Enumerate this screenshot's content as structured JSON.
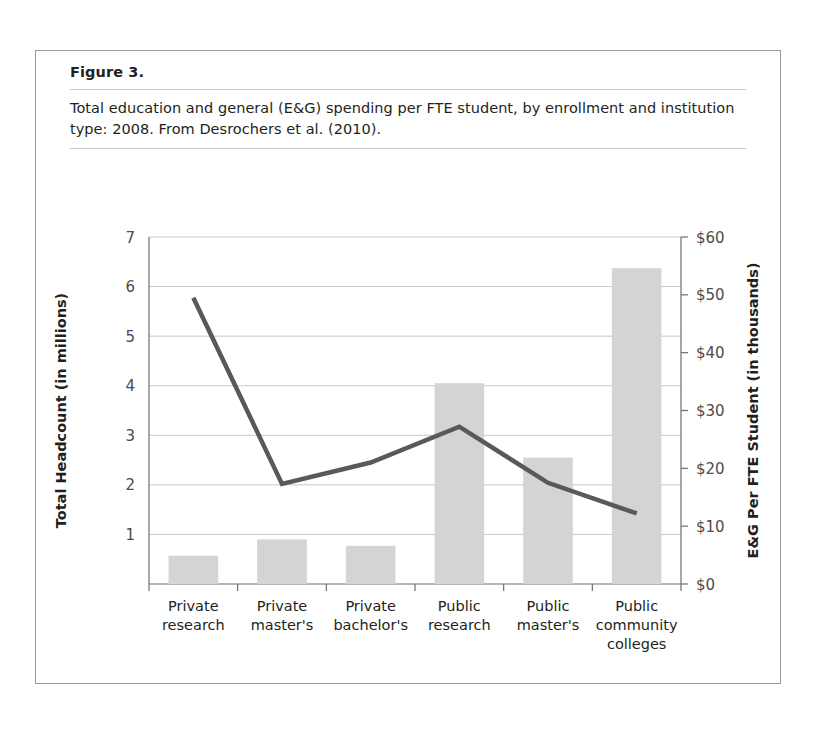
{
  "figure": {
    "number": "Figure 3.",
    "caption": "Total education and general (E&G) spending per FTE student, by enrollment and institution type: 2008. From Desrochers et al. (2010)."
  },
  "colors": {
    "bar_fill": "#d4d4d4",
    "line_stroke": "#58595b",
    "gridline": "#c8c8c8",
    "axis": "#6d6e71",
    "text": "#231f20",
    "card_border": "#9a9a9a",
    "rule": "#c9c9c9"
  },
  "legend": {
    "position": "bottom",
    "items": [
      {
        "label": "Total headcount",
        "marker": "swatch"
      },
      {
        "label": "E&G total",
        "marker": "line"
      }
    ]
  },
  "chart_data": {
    "type": "bar",
    "title": "Total education and general (E&G) spending per FTE student, by enrollment and institution type: 2008",
    "xlabel": "",
    "ylabel": "Total Headcount (in millions)",
    "y2label": "E&G Per FTE Student (in thousands)",
    "grid": true,
    "ylim": [
      0,
      7
    ],
    "y2lim": [
      0,
      60
    ],
    "yticks": [
      1,
      2,
      3,
      4,
      5,
      6,
      7
    ],
    "yticklabels": [
      "1",
      "2",
      "3",
      "4",
      "5",
      "6",
      "7"
    ],
    "y2ticks": [
      0,
      10,
      20,
      30,
      40,
      50,
      60
    ],
    "y2ticklabels": [
      "$0",
      "$10",
      "$20",
      "$30",
      "$40",
      "$50",
      "$60"
    ],
    "categories": [
      "Private research",
      "Private master's",
      "Private bachelor's",
      "Public research",
      "Public master's",
      "Public community colleges"
    ],
    "category_lines": [
      [
        "Private",
        "research"
      ],
      [
        "Private",
        "master's"
      ],
      [
        "Private",
        "bachelor's"
      ],
      [
        "Public",
        "research"
      ],
      [
        "Public",
        "master's"
      ],
      [
        "Public",
        "community",
        "colleges"
      ]
    ],
    "series": [
      {
        "name": "Total headcount",
        "type": "bar",
        "axis": "left",
        "unit": "millions",
        "values": [
          0.57,
          0.9,
          0.77,
          4.05,
          2.55,
          6.37
        ]
      },
      {
        "name": "E&G total",
        "type": "line",
        "axis": "right",
        "unit": "thousands of dollars",
        "values": [
          49.5,
          17.3,
          21.0,
          27.2,
          17.5,
          12.2
        ]
      }
    ]
  }
}
